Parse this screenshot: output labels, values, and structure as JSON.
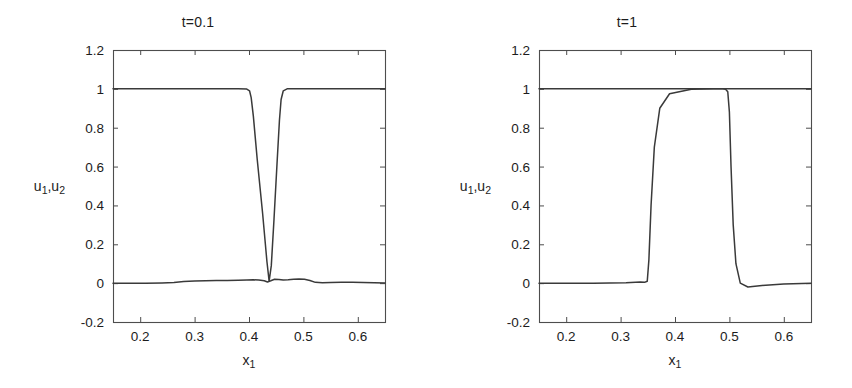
{
  "figure": {
    "background": "#ffffff",
    "line_color": "#3a3a3a",
    "axis_color": "#4d4d4d",
    "text_color": "#1c1c1c"
  },
  "chart_data": [
    {
      "type": "line",
      "title": "t=0.1",
      "xlabel": "x_1",
      "ylabel": "u_1,u_2",
      "xlim": [
        0.15,
        0.65
      ],
      "ylim": [
        -0.2,
        1.2
      ],
      "xticks": [
        0.2,
        0.3,
        0.4,
        0.5,
        0.6
      ],
      "xticklabels": [
        "0.2",
        "0.3",
        "0.4",
        "0.5",
        "0.6"
      ],
      "yticks": [
        -0.2,
        0,
        0.2,
        0.4,
        0.6,
        0.8,
        1,
        1.2
      ],
      "yticklabels": [
        "-0.2",
        "0",
        "0.2",
        "0.4",
        "0.6",
        "0.8",
        "1",
        "1.2"
      ],
      "grid": false,
      "legend": null,
      "series": [
        {
          "name": "u_1",
          "comment": "value 1 everywhere except a narrow V-shaped notch dropping to 0 near x=0.435",
          "x": [
            0.15,
            0.25,
            0.34,
            0.38,
            0.396,
            0.401,
            0.404,
            0.408,
            0.415,
            0.425,
            0.433,
            0.437,
            0.441,
            0.446,
            0.452,
            0.456,
            0.459,
            0.463,
            0.47,
            0.5,
            0.56,
            0.65
          ],
          "y": [
            1.0,
            1.0,
            1.0,
            1.0,
            0.999,
            0.99,
            0.955,
            0.86,
            0.64,
            0.36,
            0.11,
            0.01,
            0.09,
            0.33,
            0.64,
            0.84,
            0.945,
            0.99,
            1.0,
            1.0,
            1.0,
            1.0
          ]
        },
        {
          "name": "u_2",
          "comment": "near zero across the domain with small oscillations and a tiny spike at the notch",
          "x": [
            0.15,
            0.18,
            0.21,
            0.24,
            0.262,
            0.28,
            0.3,
            0.32,
            0.34,
            0.36,
            0.38,
            0.396,
            0.408,
            0.418,
            0.428,
            0.434,
            0.44,
            0.447,
            0.455,
            0.463,
            0.472,
            0.482,
            0.492,
            0.502,
            0.512,
            0.522,
            0.535,
            0.55,
            0.57,
            0.59,
            0.61,
            0.63,
            0.65
          ],
          "y": [
            0.0,
            0.0,
            0.0,
            0.001,
            0.003,
            0.008,
            0.011,
            0.012,
            0.013,
            0.014,
            0.015,
            0.016,
            0.017,
            0.016,
            0.012,
            0.006,
            0.012,
            0.02,
            0.019,
            0.016,
            0.017,
            0.02,
            0.021,
            0.02,
            0.014,
            0.004,
            0.002,
            0.003,
            0.004,
            0.004,
            0.003,
            0.002,
            0.001
          ]
        }
      ]
    },
    {
      "type": "line",
      "title": "t=1",
      "xlabel": "x_1",
      "ylabel": "u_1,u_2",
      "xlim": [
        0.15,
        0.65
      ],
      "ylim": [
        -0.2,
        1.2
      ],
      "xticks": [
        0.2,
        0.3,
        0.4,
        0.5,
        0.6
      ],
      "xticklabels": [
        "0.2",
        "0.3",
        "0.4",
        "0.5",
        "0.6"
      ],
      "yticks": [
        -0.2,
        0,
        0.2,
        0.4,
        0.6,
        0.8,
        1,
        1.2
      ],
      "yticklabels": [
        "-0.2",
        "0",
        "0.2",
        "0.4",
        "0.6",
        "0.8",
        "1",
        "1.2"
      ],
      "grid": false,
      "legend": null,
      "series": [
        {
          "name": "u_1",
          "comment": "flat at 1 across the whole domain",
          "x": [
            0.15,
            0.3,
            0.45,
            0.65
          ],
          "y": [
            1.0,
            1.0,
            1.0,
            1.0
          ]
        },
        {
          "name": "u_2",
          "comment": "square pulse: 0 until x~0.348, rises steeply to 1, plateau to x~0.497, drops steeply back to 0 with slight undershoot",
          "x": [
            0.15,
            0.25,
            0.31,
            0.336,
            0.344,
            0.349,
            0.352,
            0.356,
            0.362,
            0.372,
            0.39,
            0.43,
            0.47,
            0.488,
            0.493,
            0.497,
            0.5,
            0.503,
            0.507,
            0.512,
            0.52,
            0.534,
            0.56,
            0.6,
            0.65
          ],
          "y": [
            0.0,
            0.0,
            0.002,
            0.006,
            0.004,
            0.01,
            0.12,
            0.4,
            0.7,
            0.9,
            0.975,
            0.998,
            1.0,
            1.0,
            0.998,
            0.985,
            0.88,
            0.6,
            0.3,
            0.1,
            0.0,
            -0.02,
            -0.012,
            -0.004,
            0.0
          ]
        }
      ]
    }
  ]
}
